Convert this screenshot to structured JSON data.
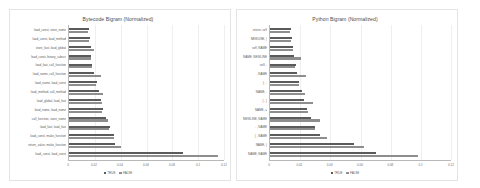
{
  "legend": {
    "series_true": "TRUE",
    "series_false": "FALSE"
  },
  "chart_data": [
    {
      "type": "bar",
      "orientation": "horizontal",
      "title": "Bytecode Bigram (Normalized)",
      "xlabel": "",
      "ylabel": "",
      "xlim": [
        0,
        0.12
      ],
      "xticks": [
        "0",
        "0.02",
        "0.04",
        "0.06",
        "0.08",
        "0.1",
        "0.12"
      ],
      "grid": true,
      "legend_position": "bottom",
      "categories": [
        "load_const, store_name",
        "load_const, load_method",
        "store_fast, load_global",
        "load_const, binary_subscr",
        "load_fast, call_function",
        "load_name, call_function",
        "load_name, load_const",
        "load_method, call_method",
        "load_global, load_fast",
        "load_name, load_name",
        "call_function, store_name",
        "load_fast, load_fast",
        "load_const, make_function",
        "return_value, make_function",
        "load_const, load_const"
      ],
      "series": [
        {
          "name": "TRUE",
          "values": [
            0.0155,
            0.016,
            0.0168,
            0.0172,
            0.018,
            0.019,
            0.0215,
            0.0235,
            0.0248,
            0.0262,
            0.029,
            0.0315,
            0.0345,
            0.0355,
            0.088
          ]
        },
        {
          "name": "FALSE",
          "values": [
            0.015,
            0.0158,
            0.019,
            0.017,
            0.0178,
            0.0245,
            0.021,
            0.0262,
            0.0255,
            0.0255,
            0.03,
            0.031,
            0.0352,
            0.04,
            0.115
          ]
        }
      ]
    },
    {
      "type": "bar",
      "orientation": "horizontal",
      "title": "Python Bigram (Normalized)",
      "xlabel": "",
      "ylabel": "",
      "xlim": [
        0,
        0.12
      ],
      "xticks": [
        "0",
        "0.02",
        "0.04",
        "0.06",
        "0.08",
        "0.1",
        "0.12"
      ],
      "grid": true,
      "legend_position": "bottom",
      "categories": [
        "return, self",
        "NEWLINE, )",
        "self, NAME",
        "NAME, NEWLINE",
        "self, .",
        ", NAME",
        ") , :",
        "NAME, .",
        "( , )",
        "NAME, =",
        "NEWLINE, NAME",
        ". , NAME",
        "( , NAME",
        "NAME, (",
        "NAME, NAME"
      ],
      "series": [
        {
          "name": "TRUE",
          "values": [
            0.014,
            0.0148,
            0.0155,
            0.0162,
            0.017,
            0.018,
            0.0195,
            0.021,
            0.0225,
            0.0248,
            0.0275,
            0.03,
            0.033,
            0.056,
            0.07
          ]
        },
        {
          "name": "FALSE",
          "values": [
            0.0135,
            0.0142,
            0.0152,
            0.0205,
            0.0168,
            0.024,
            0.0192,
            0.0235,
            0.0285,
            0.025,
            0.033,
            0.0298,
            0.038,
            0.062,
            0.098
          ]
        }
      ]
    }
  ]
}
